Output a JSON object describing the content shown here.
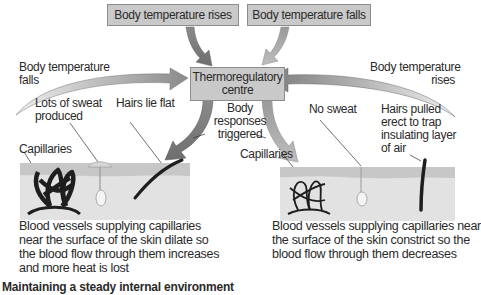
{
  "top_boxes": {
    "rises": "Body temperature rises",
    "falls": "Body temperature falls"
  },
  "centre": {
    "line1": "Thermoregulatory",
    "line2": "centre"
  },
  "responses": {
    "line1": "Body",
    "line2": "responses",
    "line3": "triggered"
  },
  "left_side": {
    "trigger_line1": "Body temperature",
    "trigger_line2": "falls",
    "sweat_line1": "Lots of sweat",
    "sweat_line2": "produced",
    "hairs": "Hairs lie flat",
    "capillaries": "Capillaries",
    "desc_lines": [
      "Blood vessels supplying capillaries",
      "near the surface of the skin dilate so",
      "the blood flow through them increases",
      "and more heat is lost"
    ]
  },
  "right_side": {
    "trigger_line1": "Body temperature",
    "trigger_line2": "rises",
    "sweat": "No sweat",
    "hairs_lines": [
      "Hairs pulled",
      "erect to trap",
      "insulating layer",
      "of air"
    ],
    "capillaries": "Capillaries",
    "desc_lines": [
      "Blood vessels supplying capillaries near",
      "the surface of the skin constrict so the",
      "blood flow through them decreases"
    ]
  },
  "caption": "Maintaining a steady internal environment",
  "colors": {
    "box_fill": "#c9c9c9",
    "arrow_dark": "#7a7a7a",
    "arrow_light": "#b4b4b4",
    "skin_surface": "#c7c7c7",
    "skin_body": "#e2e2e2",
    "vessel": "#1e1e1e"
  }
}
